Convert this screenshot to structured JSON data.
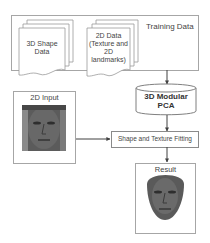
{
  "diagram": {
    "training_box": {
      "label": "Training Data"
    },
    "shape_doc": {
      "label_line1": "3D Shape",
      "label_line2": "Data"
    },
    "data2d_doc": {
      "label_line1": "2D Data",
      "label_line2": "(Texture and",
      "label_line3": "2D",
      "label_line4": "landmarks)"
    },
    "pca": {
      "label_line1": "3D Modular",
      "label_line2": "PCA"
    },
    "input_box": {
      "label": "2D Input"
    },
    "fitting_box": {
      "label": "Shape and Texture Fitting"
    },
    "result_box": {
      "label": "Result"
    }
  },
  "colors": {
    "border": "#a6a6a6",
    "arrow": "#404040",
    "face_dark": "#3a3a3a",
    "face_mid": "#6d6d6d"
  }
}
